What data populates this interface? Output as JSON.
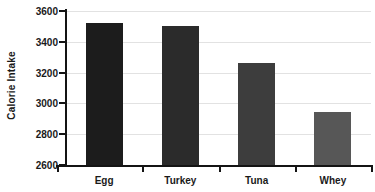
{
  "chart_data": {
    "type": "bar",
    "title": "",
    "xlabel": "",
    "ylabel": "Calorie Intake",
    "categories": [
      "Egg",
      "Turkey",
      "Tuna",
      "Whey"
    ],
    "values": [
      3520,
      3505,
      3265,
      2945
    ],
    "ylim": [
      2600,
      3600
    ],
    "yticks": [
      2600,
      2800,
      3000,
      3200,
      3400,
      3600
    ],
    "ytick_labels": [
      "2600",
      "2800",
      "3000",
      "3200",
      "3400",
      "3600"
    ],
    "grid": true,
    "legend": "none",
    "bar_colors": [
      "#1c1c1c",
      "#2b2b2b",
      "#3d3d3d",
      "#575757"
    ],
    "axis_color": "#141414",
    "gridline_color": "#e2e2e2",
    "background_color": "#ffffff"
  }
}
